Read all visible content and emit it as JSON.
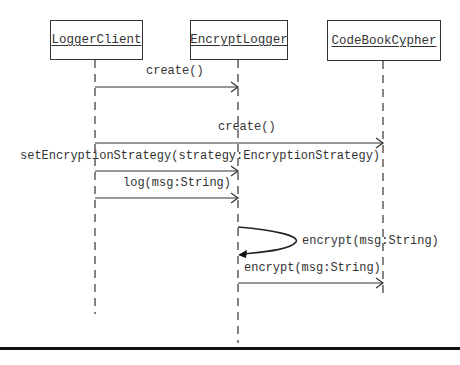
{
  "diagram": {
    "type": "uml-sequence",
    "participants": [
      {
        "id": "loggerclient",
        "name": "LoggerClient"
      },
      {
        "id": "encryptlogger",
        "name": "EncryptLogger"
      },
      {
        "id": "codebookcypher",
        "name": "CodeBookCypher"
      }
    ],
    "messages": [
      {
        "from": "LoggerClient",
        "to": "EncryptLogger",
        "label": "create()"
      },
      {
        "from": "LoggerClient",
        "to": "CodeBookCypher",
        "label": "create()"
      },
      {
        "from": "LoggerClient",
        "to": "EncryptLogger",
        "label": "setEncryptionStrategy(strategy:EncryptionStrategy)"
      },
      {
        "from": "LoggerClient",
        "to": "EncryptLogger",
        "label": "log(msg:String)"
      },
      {
        "from": "EncryptLogger",
        "to": "EncryptLogger",
        "label": "encrypt(msg:String)",
        "self_call": true
      },
      {
        "from": "EncryptLogger",
        "to": "CodeBookCypher",
        "label": "encrypt(msg:String)"
      }
    ]
  }
}
